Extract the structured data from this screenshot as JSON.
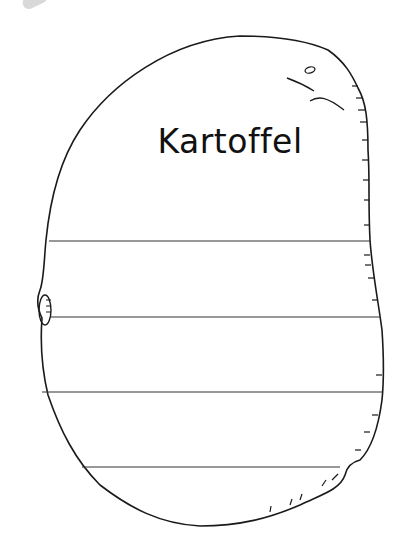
{
  "worksheet": {
    "title": "Kartoffel",
    "shape": "potato-outline",
    "writing_lines": 4,
    "line_color": "#333333",
    "outline_color": "#1a1a1a"
  }
}
